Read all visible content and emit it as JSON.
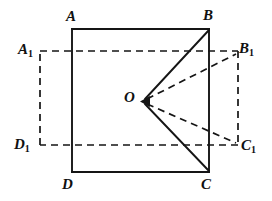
{
  "figure": {
    "kind": "geometry-diagram",
    "background_color": "#ffffff",
    "ink_color": "#151515",
    "width": 272,
    "height": 201,
    "labels": {
      "A": "A",
      "B": "B",
      "C": "C",
      "D": "D",
      "O": "O",
      "A1_base": "A",
      "A1_sub": "1",
      "B1_base": "B",
      "B1_sub": "1",
      "C1_base": "C",
      "C1_sub": "1",
      "D1_base": "D",
      "D1_sub": "1"
    },
    "points": {
      "A": {
        "x": 72,
        "y": 29
      },
      "B": {
        "x": 209,
        "y": 29
      },
      "C": {
        "x": 209,
        "y": 172
      },
      "D": {
        "x": 72,
        "y": 172
      },
      "A1": {
        "x": 40,
        "y": 51
      },
      "B1": {
        "x": 238,
        "y": 51
      },
      "C1": {
        "x": 238,
        "y": 145
      },
      "D1": {
        "x": 40,
        "y": 145
      },
      "O": {
        "x": 143,
        "y": 101
      }
    },
    "shapes": {
      "solid_square": "A-B-C-D",
      "dashed_rectangle": "A1-B1-C1-D1",
      "solid_rays": [
        "O-B",
        "O-C"
      ],
      "dashed_rays": [
        "O-B1",
        "O-C1"
      ],
      "arrow_head_at": "O"
    },
    "stroke_widths": {
      "solid": 1.9,
      "dashed": 1.7
    },
    "dash_pattern": "7 5"
  }
}
